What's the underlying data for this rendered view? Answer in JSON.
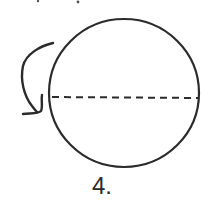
{
  "figure": {
    "label": "4.",
    "shape": "circle",
    "diameter_line": "dashed-horizontal",
    "arrow": "curved-rotation-arrow",
    "stroke_color": "#2b2b2b",
    "background": "#ffffff"
  }
}
